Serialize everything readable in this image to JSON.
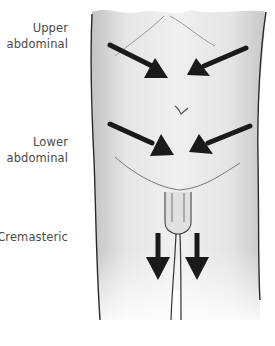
{
  "diagram": {
    "type": "anatomical-illustration",
    "labels": [
      {
        "id": "upper",
        "line1": "Upper",
        "line2": "abdominal"
      },
      {
        "id": "lower",
        "line1": "Lower",
        "line2": "abdominal"
      },
      {
        "id": "cremasteric",
        "line1": "Cremasteric",
        "line2": ""
      }
    ],
    "arrows": [
      {
        "region": "upper",
        "direction": "inward-down",
        "side": "left"
      },
      {
        "region": "upper",
        "direction": "inward-down",
        "side": "right"
      },
      {
        "region": "lower",
        "direction": "inward-down",
        "side": "left"
      },
      {
        "region": "lower",
        "direction": "inward-down",
        "side": "right"
      },
      {
        "region": "cremasteric",
        "direction": "down",
        "side": "left"
      },
      {
        "region": "cremasteric",
        "direction": "down",
        "side": "right"
      }
    ],
    "colors": {
      "arrow": "#1a1a1a",
      "outline": "#2a2a2a",
      "skin_shade": "#c8c8c8",
      "text": "#4a4a4a"
    }
  }
}
